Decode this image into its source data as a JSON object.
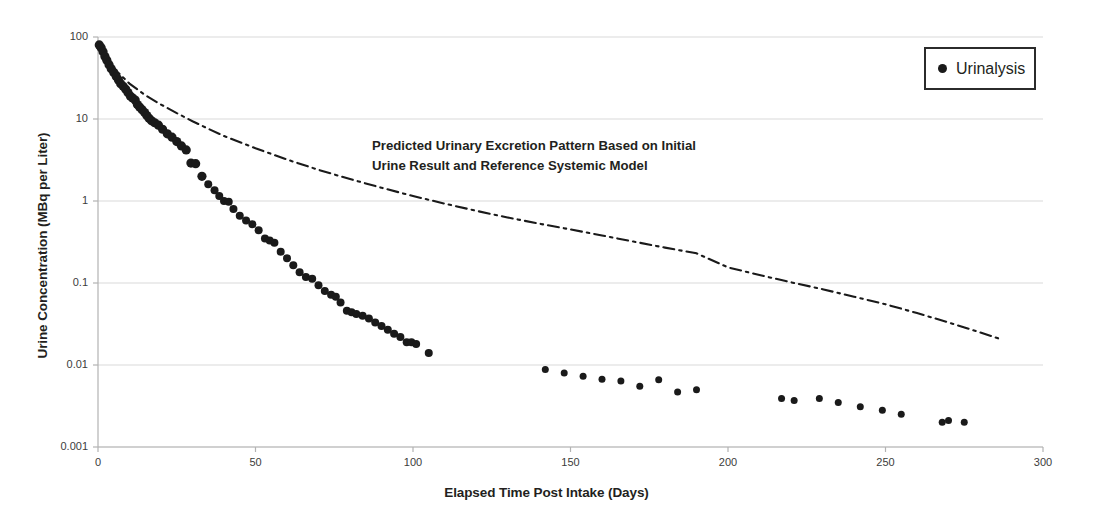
{
  "chart_data": {
    "type": "scatter",
    "title": "",
    "xlabel": "Elapsed Time Post Intake (Days)",
    "ylabel": "Urine Concentration (MBq per Liter)",
    "xlim": [
      0,
      300
    ],
    "ylim": [
      0.001,
      100
    ],
    "yscale": "log",
    "xscale": "linear",
    "grid": true,
    "legend_position": "top-right",
    "xticks": [
      0,
      50,
      100,
      150,
      200,
      250,
      300
    ],
    "xtick_labels": [
      "0",
      "50",
      "100",
      "150",
      "200",
      "250",
      "300"
    ],
    "yticks": [
      0.001,
      0.01,
      0.1,
      1,
      10,
      100
    ],
    "ytick_labels": [
      "0.001",
      "0.01",
      "0.1",
      "1",
      "10",
      "100"
    ],
    "annotations": [
      {
        "text": "Predicted Urinary Excretion Pattern Based on Initial\nUrine Result and Reference Systemic Model",
        "x": 60,
        "y": 3.5
      }
    ],
    "series": [
      {
        "name": "Urinalysis",
        "type": "scatter",
        "marker": "circle",
        "color": "#1a1a1a",
        "points": [
          [
            0.4,
            80
          ],
          [
            1.0,
            74
          ],
          [
            1.6,
            66
          ],
          [
            2.2,
            58
          ],
          [
            2.8,
            52
          ],
          [
            3.5,
            46
          ],
          [
            4.2,
            41
          ],
          [
            5.0,
            37
          ],
          [
            5.8,
            33
          ],
          [
            6.5,
            30
          ],
          [
            7.2,
            27
          ],
          [
            8.0,
            25
          ],
          [
            8.8,
            23
          ],
          [
            9.5,
            21
          ],
          [
            10.3,
            19
          ],
          [
            11.0,
            18
          ],
          [
            11.8,
            17
          ],
          [
            12.5,
            15
          ],
          [
            13.2,
            14
          ],
          [
            14.0,
            13
          ],
          [
            14.8,
            12
          ],
          [
            15.5,
            11
          ],
          [
            16.2,
            10.2
          ],
          [
            17.0,
            9.5
          ],
          [
            18.0,
            9.0
          ],
          [
            19.2,
            8.4
          ],
          [
            20.5,
            7.5
          ],
          [
            22.0,
            6.6
          ],
          [
            23.5,
            6.0
          ],
          [
            25.0,
            5.3
          ],
          [
            26.5,
            4.7
          ],
          [
            28.0,
            4.2
          ],
          [
            29.5,
            2.9
          ],
          [
            31.0,
            2.85
          ],
          [
            33.0,
            2.0
          ],
          [
            35.0,
            1.6
          ],
          [
            37.0,
            1.35
          ],
          [
            38.5,
            1.15
          ],
          [
            40.0,
            1.0
          ],
          [
            41.5,
            0.98
          ],
          [
            43.0,
            0.8
          ],
          [
            45.0,
            0.66
          ],
          [
            47.0,
            0.58
          ],
          [
            49.0,
            0.52
          ],
          [
            51.0,
            0.44
          ],
          [
            53.0,
            0.35
          ],
          [
            54.5,
            0.33
          ],
          [
            56.0,
            0.31
          ],
          [
            58.0,
            0.24
          ],
          [
            60.0,
            0.2
          ],
          [
            62.0,
            0.165
          ],
          [
            64.0,
            0.135
          ],
          [
            66.0,
            0.118
          ],
          [
            68.0,
            0.113
          ],
          [
            70.0,
            0.094
          ],
          [
            72.0,
            0.08
          ],
          [
            74.0,
            0.072
          ],
          [
            75.5,
            0.068
          ],
          [
            77.0,
            0.058
          ],
          [
            79.0,
            0.046
          ],
          [
            80.5,
            0.044
          ],
          [
            82.0,
            0.042
          ],
          [
            84.0,
            0.04
          ],
          [
            86.0,
            0.037
          ],
          [
            88.0,
            0.033
          ],
          [
            90.0,
            0.03
          ],
          [
            92.0,
            0.027
          ],
          [
            94.0,
            0.024
          ],
          [
            96.0,
            0.022
          ],
          [
            98.0,
            0.019
          ],
          [
            99.5,
            0.019
          ],
          [
            101.0,
            0.018
          ],
          [
            105.0,
            0.014
          ],
          [
            142.0,
            0.0088
          ],
          [
            148.0,
            0.008
          ],
          [
            154.0,
            0.0073
          ],
          [
            160.0,
            0.0067
          ],
          [
            166.0,
            0.0064
          ],
          [
            172.0,
            0.0055
          ],
          [
            178.0,
            0.0066
          ],
          [
            184.0,
            0.0047
          ],
          [
            190.0,
            0.005
          ],
          [
            217.0,
            0.0039
          ],
          [
            221.0,
            0.0037
          ],
          [
            229.0,
            0.0039
          ],
          [
            235.0,
            0.0035
          ],
          [
            242.0,
            0.0031
          ],
          [
            249.0,
            0.0028
          ],
          [
            255.0,
            0.0025
          ],
          [
            268.0,
            0.002
          ],
          [
            270.0,
            0.0021
          ],
          [
            275.0,
            0.002
          ]
        ]
      },
      {
        "name": "Predicted Urinary Excretion Pattern",
        "type": "line",
        "linestyle": "dashdot",
        "color": "#1a1a1a",
        "points": [
          [
            0.5,
            78
          ],
          [
            3,
            52
          ],
          [
            6,
            38
          ],
          [
            10,
            27
          ],
          [
            15,
            19.5
          ],
          [
            20,
            15.0
          ],
          [
            25,
            11.8
          ],
          [
            30,
            9.4
          ],
          [
            35,
            7.6
          ],
          [
            40,
            6.2
          ],
          [
            50,
            4.4
          ],
          [
            60,
            3.2
          ],
          [
            70,
            2.4
          ],
          [
            80,
            1.85
          ],
          [
            90,
            1.45
          ],
          [
            100,
            1.15
          ],
          [
            110,
            0.93
          ],
          [
            120,
            0.76
          ],
          [
            130,
            0.63
          ],
          [
            140,
            0.53
          ],
          [
            150,
            0.45
          ],
          [
            160,
            0.38
          ],
          [
            170,
            0.32
          ],
          [
            180,
            0.27
          ],
          [
            190,
            0.23
          ],
          [
            200,
            0.155
          ],
          [
            210,
            0.125
          ],
          [
            220,
            0.102
          ],
          [
            230,
            0.084
          ],
          [
            240,
            0.068
          ],
          [
            250,
            0.055
          ],
          [
            260,
            0.043
          ],
          [
            270,
            0.033
          ],
          [
            280,
            0.025
          ],
          [
            286,
            0.021
          ]
        ]
      }
    ]
  },
  "axes": {
    "x_title": "Elapsed Time Post Intake (Days)",
    "y_title": "Urine Concentration (MBq per Liter)"
  },
  "legend": {
    "label": "Urinalysis"
  },
  "annotation": {
    "line1": "Predicted Urinary Excretion Pattern Based on Initial",
    "line2": "Urine Result and Reference Systemic Model"
  },
  "colors": {
    "marker": "#1a1a1a",
    "grid": "#d9d9d9",
    "axis": "#b3b3b3",
    "text": "#231f20"
  }
}
